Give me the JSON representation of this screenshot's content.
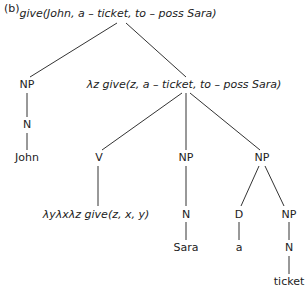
{
  "panel_label": "(b)",
  "tree": {
    "root": "give(John, a – ticket, to – poss Sara)",
    "subject": {
      "np": "NP",
      "n": "N",
      "word": "John"
    },
    "vp": {
      "label": "λz give(z, a – ticket, to – poss Sara)",
      "v": {
        "cat": "V",
        "semantics": "λyλxλz give(z, x, y)"
      },
      "np1": {
        "cat": "NP",
        "n": "N",
        "word": "Sara"
      },
      "np2": {
        "cat": "NP",
        "d": "D",
        "det": "a",
        "np": "NP",
        "n": "N",
        "word": "ticket"
      }
    }
  }
}
